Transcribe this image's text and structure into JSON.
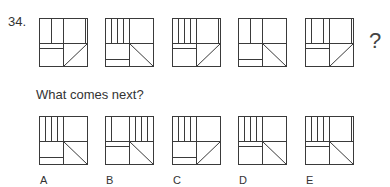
{
  "question": {
    "number": "34.",
    "prompt": "What comes next?",
    "missing_marker": "?"
  },
  "colors": {
    "line": "#3a3a3a",
    "background": "#ffffff"
  },
  "sequence": [
    {
      "id": "s1",
      "lines": [
        [
          12,
          0,
          12,
          25
        ],
        [
          24,
          0,
          24,
          48
        ],
        [
          46,
          0,
          46,
          25
        ],
        [
          0,
          25,
          48,
          25
        ],
        [
          0,
          30,
          24,
          30
        ],
        [
          24,
          48,
          48,
          25
        ]
      ]
    },
    {
      "id": "s2",
      "lines": [
        [
          6,
          0,
          6,
          25
        ],
        [
          12,
          0,
          12,
          25
        ],
        [
          18,
          0,
          18,
          25
        ],
        [
          24,
          0,
          24,
          48
        ],
        [
          0,
          25,
          48,
          25
        ],
        [
          0,
          41,
          24,
          41
        ],
        [
          24,
          25,
          48,
          48
        ]
      ]
    },
    {
      "id": "s3",
      "lines": [
        [
          6,
          0,
          6,
          25
        ],
        [
          12,
          0,
          12,
          25
        ],
        [
          18,
          0,
          18,
          25
        ],
        [
          24,
          0,
          24,
          48
        ],
        [
          46,
          0,
          46,
          25
        ],
        [
          0,
          25,
          48,
          25
        ],
        [
          0,
          30,
          24,
          30
        ],
        [
          24,
          48,
          48,
          25
        ]
      ]
    },
    {
      "id": "s4",
      "lines": [
        [
          12,
          0,
          12,
          25
        ],
        [
          24,
          0,
          24,
          48
        ],
        [
          0,
          25,
          48,
          25
        ],
        [
          0,
          41,
          24,
          41
        ],
        [
          24,
          25,
          48,
          48
        ]
      ]
    },
    {
      "id": "s5",
      "lines": [
        [
          6,
          0,
          6,
          25
        ],
        [
          18,
          0,
          18,
          25
        ],
        [
          24,
          0,
          24,
          48
        ],
        [
          46,
          0,
          46,
          25
        ],
        [
          0,
          25,
          48,
          25
        ],
        [
          0,
          30,
          24,
          30
        ],
        [
          24,
          48,
          48,
          25
        ]
      ]
    }
  ],
  "options": [
    {
      "label": "A",
      "lines": [
        [
          6,
          0,
          6,
          25
        ],
        [
          12,
          0,
          12,
          25
        ],
        [
          18,
          0,
          18,
          25
        ],
        [
          24,
          0,
          24,
          48
        ],
        [
          0,
          25,
          48,
          25
        ],
        [
          0,
          41,
          24,
          41
        ],
        [
          24,
          25,
          48,
          48
        ]
      ]
    },
    {
      "label": "B",
      "lines": [
        [
          6,
          0,
          6,
          25
        ],
        [
          24,
          0,
          24,
          48
        ],
        [
          30,
          0,
          30,
          25
        ],
        [
          36,
          0,
          36,
          25
        ],
        [
          42,
          0,
          42,
          25
        ],
        [
          0,
          25,
          48,
          25
        ],
        [
          0,
          30,
          24,
          30
        ],
        [
          24,
          25,
          48,
          48
        ]
      ]
    },
    {
      "label": "C",
      "lines": [
        [
          6,
          0,
          6,
          25
        ],
        [
          12,
          0,
          12,
          25
        ],
        [
          18,
          0,
          18,
          25
        ],
        [
          24,
          0,
          24,
          48
        ],
        [
          0,
          25,
          48,
          25
        ],
        [
          0,
          41,
          24,
          41
        ],
        [
          24,
          48,
          48,
          25
        ]
      ]
    },
    {
      "label": "D",
      "lines": [
        [
          6,
          0,
          6,
          25
        ],
        [
          12,
          0,
          12,
          25
        ],
        [
          18,
          0,
          18,
          25
        ],
        [
          24,
          0,
          24,
          48
        ],
        [
          0,
          25,
          48,
          25
        ],
        [
          0,
          30,
          24,
          30
        ],
        [
          24,
          25,
          48,
          48
        ]
      ]
    },
    {
      "label": "E",
      "lines": [
        [
          6,
          0,
          6,
          25
        ],
        [
          12,
          0,
          12,
          25
        ],
        [
          18,
          0,
          18,
          25
        ],
        [
          24,
          0,
          24,
          48
        ],
        [
          46,
          0,
          46,
          25
        ],
        [
          0,
          25,
          48,
          25
        ],
        [
          0,
          30,
          24,
          30
        ],
        [
          24,
          25,
          48,
          48
        ]
      ]
    }
  ]
}
